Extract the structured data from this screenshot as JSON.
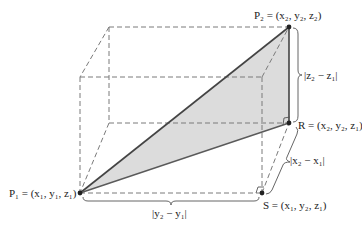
{
  "diagram": {
    "colors": {
      "triangle_fill": "#dcdcdc",
      "dashed_lines": "#7a7a7a",
      "solid_lines": "#5a5a5a",
      "text": "#222222"
    },
    "points": {
      "P1": {
        "label": "P₁ = (x₁, y₁, z₁)",
        "x": 80,
        "y": 193
      },
      "P2": {
        "label": "P₂ = (x₂, y₂, z₂)",
        "x": 289,
        "y": 27
      },
      "R": {
        "label": "R = (x₂, y₂, z₁)",
        "x": 289,
        "y": 123
      },
      "S": {
        "label": "S = (x₁, y₂, z₁)",
        "x": 262,
        "y": 193
      }
    },
    "box_corners": {
      "back_top_left": [
        109,
        27
      ],
      "front_top_left": [
        80,
        77
      ],
      "front_top_right": [
        262,
        77
      ],
      "back_bottom_left": [
        109,
        123
      ]
    },
    "measurements": {
      "dz": "|z₂ − z₁|",
      "dx": "|x₂ − x₁|",
      "dy": "|y₂ − y₁|"
    }
  }
}
